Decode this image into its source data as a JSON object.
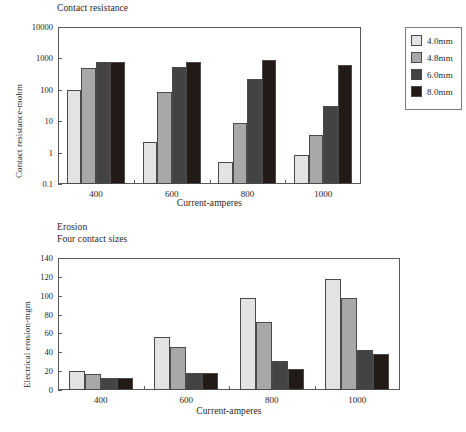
{
  "legend": {
    "position": "top-right",
    "entries": [
      {
        "label": "4.0mm",
        "color": "#e3e3e3"
      },
      {
        "label": "4.8mm",
        "color": "#a8a8a8"
      },
      {
        "label": "6.0mm",
        "color": "#434343"
      },
      {
        "label": "8.0mm",
        "color": "#221a17"
      }
    ]
  },
  "chart_data": [
    {
      "id": "contact-resistance",
      "type": "bar",
      "title": "Contact resistance",
      "xlabel": "Current-amperes",
      "ylabel": "Contact resistance-mohm",
      "yscale": "log",
      "ylim": [
        0.1,
        10000
      ],
      "yticks": [
        0.1,
        1,
        10,
        100,
        1000,
        10000
      ],
      "ytick_labels": [
        "0.1",
        "1",
        "10",
        "100",
        "1000",
        "10000"
      ],
      "grid": false,
      "categories": [
        "400",
        "600",
        "800",
        "1000"
      ],
      "series": [
        {
          "name": "4.0mm",
          "color": "#e3e3e3",
          "values": [
            100,
            2.1,
            0.52,
            0.82
          ]
        },
        {
          "name": "4.8mm",
          "color": "#a8a8a8",
          "values": [
            510,
            83,
            8.5,
            3.6
          ]
        },
        {
          "name": "6.0mm",
          "color": "#434343",
          "values": [
            760,
            520,
            220,
            30
          ]
        },
        {
          "name": "8.0mm",
          "color": "#221a17",
          "values": [
            760,
            760,
            880,
            620
          ]
        }
      ]
    },
    {
      "id": "electrical-erosion",
      "type": "bar",
      "title": "Erosion\nFour contact sizes",
      "xlabel": "Current-amperes",
      "ylabel": "Electrical erosion-mgm",
      "yscale": "linear",
      "ylim": [
        0,
        140
      ],
      "yticks": [
        0,
        20,
        40,
        60,
        80,
        100,
        120,
        140
      ],
      "ytick_labels": [
        "0",
        "20",
        "40",
        "60",
        "80",
        "100",
        "120",
        "140"
      ],
      "grid": false,
      "categories": [
        "400",
        "600",
        "800",
        "1000"
      ],
      "series": [
        {
          "name": "4.0mm",
          "color": "#e3e3e3",
          "values": [
            20.5,
            56,
            97.5,
            118
          ]
        },
        {
          "name": "4.8mm",
          "color": "#a8a8a8",
          "values": [
            17,
            46,
            72,
            97.5
          ]
        },
        {
          "name": "6.0mm",
          "color": "#434343",
          "values": [
            12.5,
            18,
            31,
            42.5
          ]
        },
        {
          "name": "8.0mm",
          "color": "#221a17",
          "values": [
            12.5,
            18,
            22.5,
            38
          ]
        }
      ]
    }
  ]
}
